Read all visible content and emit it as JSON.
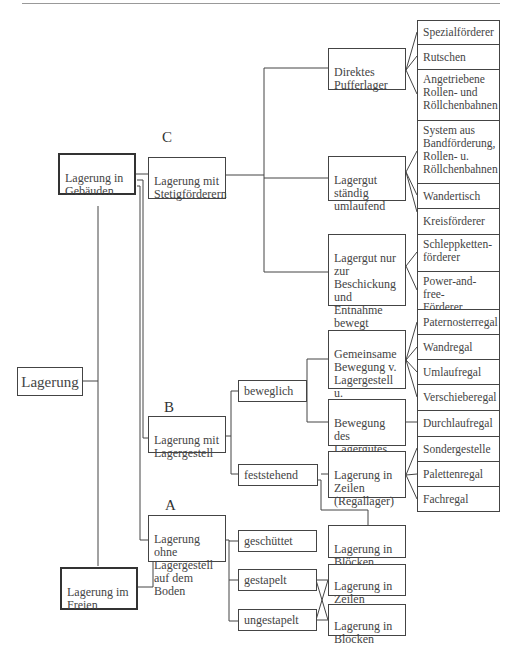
{
  "diagram": {
    "root": "Lagerung",
    "branches": {
      "in_buildings": "Lagerung in\nGebäuden",
      "outdoors": "Lagerung im\nFreien"
    },
    "section_letters": {
      "C": "C",
      "B": "B",
      "A": "A"
    },
    "level2": {
      "C": "Lagerung mit\nStetigförderern",
      "B": "Lagerung mit\nLagergestell",
      "A": "Lagerung ohne\nLagergestell\nauf dem Boden"
    },
    "C_children": [
      "Direktes\nPufferlager",
      "Lagergut\nständig\numlaufend",
      "Lagergut nur\nzur\nBeschickung\nund Entnahme\nbewegt"
    ],
    "B_children": [
      "beweglich",
      "feststehend"
    ],
    "B_beweglich_children": [
      "Gemeinsame\nBewegung v.\nLagergestell u.\nLagergut",
      "Bewegung des\nLagergutes im\nLagergestell"
    ],
    "B_feststehend_children": [
      "Lagerung in\nZeilen\n(Regallager)",
      "Lagerung in\nBlöcken"
    ],
    "A_children": [
      "geschüttet",
      "gestapelt",
      "ungestapelt"
    ],
    "A_leaves": [
      "Lagerung in\nZeilen",
      "Lagerung in\nBlöcken"
    ],
    "right_column": [
      "Spezialförderer",
      "Rutschen",
      "Angetriebene\nRollen- und\nRöllchenbahnen",
      "System aus\nBandförderung,\nRollen- u.\nRöllchenbahnen",
      "Wandertisch",
      "Kreisförderer",
      "Schleppketten-\nförderer",
      "Power-and-free-\nFörderer",
      "Paternosterregal",
      "Wandregal",
      "Umlaufregal",
      "Verschieberegal",
      "Durchlaufregal",
      "Sondergestelle",
      "Palettenregal",
      "Fachregal"
    ]
  }
}
